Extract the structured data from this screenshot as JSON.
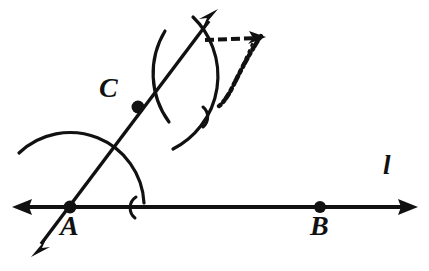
{
  "figure": {
    "background_color": "#ffffff",
    "ink_color": "#111111",
    "width": 429,
    "height": 271
  },
  "labels": {
    "point_a": "A",
    "point_b": "B",
    "point_c": "C",
    "line_l": "l"
  },
  "points": [
    {
      "name": "A",
      "label": "A",
      "x": 70,
      "y": 207,
      "radius": 6.5,
      "on": "line-l"
    },
    {
      "name": "B",
      "label": "B",
      "x": 320,
      "y": 207,
      "radius": 6.0,
      "on": "line-l"
    },
    {
      "name": "C",
      "label": "C",
      "x": 138,
      "y": 107,
      "radius": 6.5,
      "on": "ray-ac"
    }
  ],
  "lines": [
    {
      "name": "line-l",
      "label": "l",
      "kind": "double-arrow-line",
      "x1": 14,
      "y1": 207,
      "x2": 416,
      "y2": 207,
      "stroke_width": 4,
      "arrow_start": true,
      "arrow_end": true
    },
    {
      "name": "ray-ac",
      "label": "",
      "kind": "double-arrow-line",
      "x1": 33,
      "y1": 255,
      "x2": 216,
      "y2": 12,
      "stroke_width": 3.4,
      "arrow_start": true,
      "arrow_end": true
    }
  ],
  "arcs": [
    {
      "name": "arc-about-a",
      "description": "Compass arc centered at A crossing the ray and line l",
      "center_x": 70,
      "center_y": 207,
      "radius": 74,
      "start_angle_deg": -133,
      "end_angle_deg": -3,
      "stroke_width": 3.2
    },
    {
      "name": "arc-tick-on-line-l",
      "description": "Short arc tick where the A-arc meets line l",
      "center_x": 142,
      "center_y": 207,
      "radius": 13,
      "start_angle_deg": 120,
      "end_angle_deg": 255,
      "stroke_width": 3.0
    },
    {
      "name": "arc-upper-left",
      "description": "Compass arc crossing the ray in the upper region, opening right",
      "center_x": 236,
      "center_y": 72,
      "radius": 82,
      "start_angle_deg": 150,
      "end_angle_deg": 218,
      "stroke_width": 3.2
    },
    {
      "name": "arc-upper-right",
      "description": "Compass arc crossing the ray from upper right down to lower area",
      "center_x": 130,
      "center_y": 70,
      "radius": 82,
      "start_angle_deg": -40,
      "end_angle_deg": 58,
      "stroke_width": 3.2
    },
    {
      "name": "arc-tick-upper",
      "description": "Short arc tick near the upper intersection",
      "center_x": 212,
      "center_y": 118,
      "radius": 13,
      "start_angle_deg": 135,
      "end_angle_deg": 265,
      "stroke_width": 3.0
    }
  ],
  "sketch_marks": [
    {
      "name": "dashed-arrow-mark",
      "description": "Rough hand-sketched dashed horizontal arrow with a ragged downward stroke, upper right of the ray",
      "x": 205,
      "y": 32,
      "width": 62,
      "height": 72
    }
  ]
}
